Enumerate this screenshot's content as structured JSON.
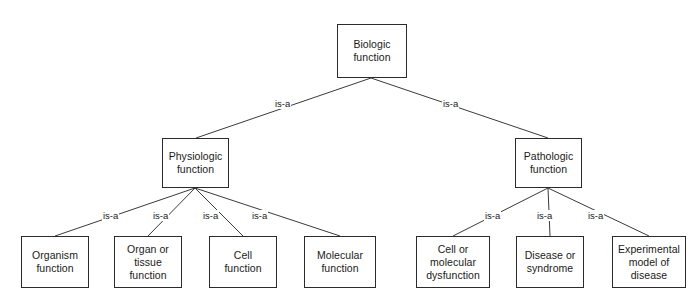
{
  "diagram": {
    "type": "hierarchy-tree",
    "relation_label": "is-a",
    "background_color": "#ffffff",
    "node_border_color": "#2b2b2b",
    "edge_color": "#3a3a3a",
    "text_color": "#1a1a1a",
    "nodes": [
      {
        "id": "biologic",
        "label": "Biologic\nfunction",
        "level": 0,
        "x": 337,
        "y": 24,
        "w": 70,
        "h": 54
      },
      {
        "id": "physiologic",
        "label": "Physiologic\nfunction",
        "level": 1,
        "x": 162,
        "y": 138,
        "w": 67,
        "h": 50
      },
      {
        "id": "pathologic",
        "label": "Pathologic\nfunction",
        "level": 1,
        "x": 515,
        "y": 138,
        "w": 67,
        "h": 50
      },
      {
        "id": "organism",
        "label": "Organism\nfunction",
        "level": 2,
        "x": 21,
        "y": 236,
        "w": 68,
        "h": 52
      },
      {
        "id": "organ",
        "label": "Organ or\ntissue\nfunction",
        "level": 2,
        "x": 114,
        "y": 236,
        "w": 68,
        "h": 52
      },
      {
        "id": "cell",
        "label": "Cell\nfunction",
        "level": 2,
        "x": 209,
        "y": 236,
        "w": 68,
        "h": 52
      },
      {
        "id": "molecular",
        "label": "Molecular\nfunction",
        "level": 2,
        "x": 304,
        "y": 236,
        "w": 72,
        "h": 52
      },
      {
        "id": "dysfunction",
        "label": "Cell or\nmolecular\ndysfunction",
        "level": 2,
        "x": 416,
        "y": 236,
        "w": 74,
        "h": 52
      },
      {
        "id": "disease",
        "label": "Disease or\nsyndrome",
        "level": 2,
        "x": 516,
        "y": 236,
        "w": 68,
        "h": 52
      },
      {
        "id": "experimental",
        "label": "Experimental\nmodel of\ndisease",
        "level": 2,
        "x": 612,
        "y": 236,
        "w": 74,
        "h": 52
      }
    ],
    "edges": [
      {
        "from": "biologic",
        "to": "physiologic",
        "label": "is-a",
        "x1": 371,
        "y1": 78,
        "x2": 196,
        "y2": 138,
        "lx": 274,
        "ly": 98
      },
      {
        "from": "biologic",
        "to": "pathologic",
        "label": "is-a",
        "x1": 371,
        "y1": 78,
        "x2": 548,
        "y2": 138,
        "lx": 442,
        "ly": 98
      },
      {
        "from": "physiologic",
        "to": "organism",
        "label": "is-a",
        "x1": 195,
        "y1": 188,
        "x2": 55,
        "y2": 236,
        "lx": 102,
        "ly": 210
      },
      {
        "from": "physiologic",
        "to": "organ",
        "label": "is-a",
        "x1": 195,
        "y1": 188,
        "x2": 148,
        "y2": 236,
        "lx": 152,
        "ly": 210
      },
      {
        "from": "physiologic",
        "to": "cell",
        "label": "is-a",
        "x1": 195,
        "y1": 188,
        "x2": 243,
        "y2": 236,
        "lx": 202,
        "ly": 210
      },
      {
        "from": "physiologic",
        "to": "molecular",
        "label": "is-a",
        "x1": 195,
        "y1": 188,
        "x2": 340,
        "y2": 236,
        "lx": 251,
        "ly": 210
      },
      {
        "from": "pathologic",
        "to": "dysfunction",
        "label": "is-a",
        "x1": 548,
        "y1": 188,
        "x2": 453,
        "y2": 236,
        "lx": 484,
        "ly": 210
      },
      {
        "from": "pathologic",
        "to": "disease",
        "label": "is-a",
        "x1": 548,
        "y1": 188,
        "x2": 550,
        "y2": 236,
        "lx": 536,
        "ly": 210
      },
      {
        "from": "pathologic",
        "to": "experimental",
        "label": "is-a",
        "x1": 548,
        "y1": 188,
        "x2": 649,
        "y2": 236,
        "lx": 587,
        "ly": 210
      }
    ]
  }
}
